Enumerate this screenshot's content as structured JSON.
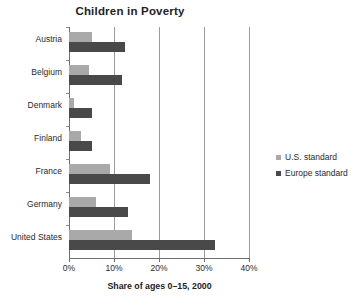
{
  "chart_data": {
    "type": "bar",
    "orientation": "horizontal",
    "title": "Children in Poverty",
    "xlabel": "Share of ages 0–15, 2000",
    "ylabel": "",
    "categories": [
      "Austria",
      "Belgium",
      "Denmark",
      "Finland",
      "France",
      "Germany",
      "United States"
    ],
    "series": [
      {
        "name": "U.S. standard",
        "color": "#a9a9a9",
        "values": [
          5.0,
          4.5,
          1.0,
          2.7,
          9.0,
          6.0,
          14.0
        ]
      },
      {
        "name": "Europe standard",
        "color": "#494949",
        "values": [
          12.5,
          11.8,
          5.0,
          5.2,
          18.0,
          13.0,
          32.5
        ]
      }
    ],
    "xlim": [
      0,
      40
    ],
    "xticks": [
      0,
      10,
      20,
      30,
      40
    ],
    "xtick_labels": [
      "0%",
      "10%",
      "20%",
      "30%",
      "40%"
    ],
    "grid": true,
    "grid_axis": "x",
    "legend_position": "right"
  },
  "legend": {
    "items": [
      {
        "label": "U.S. standard",
        "color": "#a9a9a9"
      },
      {
        "label": "Europe standard",
        "color": "#494949"
      }
    ]
  }
}
